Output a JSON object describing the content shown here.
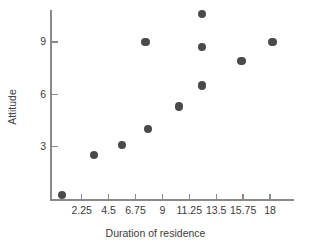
{
  "chart_data": {
    "type": "scatter",
    "title": "",
    "xlabel": "Duration of residence",
    "ylabel": "Attitude",
    "xlim": [
      0,
      19.7
    ],
    "ylim": [
      0,
      11.3
    ],
    "grid": false,
    "legend": null,
    "xticks": [
      2.25,
      4.5,
      6.75,
      9,
      11.25,
      13.5,
      15.75,
      18
    ],
    "xtick_labels": [
      "2.25",
      "4.5",
      "6.75",
      "9",
      "11.25",
      "13.5",
      "15.75",
      "18"
    ],
    "yticks": [
      3,
      6,
      9
    ],
    "ytick_labels": [
      "3",
      "6",
      "9"
    ],
    "marker": "filled-circle",
    "marker_color": "#4a4a4a",
    "axis_color": "#8a8a8a",
    "text_color": "#3b3b3b",
    "background_color": "#ffffff",
    "points": [
      {
        "x": 0.6,
        "y": 0.2
      },
      {
        "x": 3.3,
        "y": 2.5
      },
      {
        "x": 5.6,
        "y": 3.1
      },
      {
        "x": 7.6,
        "y": 9.0
      },
      {
        "x": 7.8,
        "y": 4.0
      },
      {
        "x": 10.4,
        "y": 5.3
      },
      {
        "x": 12.3,
        "y": 10.6
      },
      {
        "x": 12.3,
        "y": 8.7
      },
      {
        "x": 12.3,
        "y": 6.5
      },
      {
        "x": 15.6,
        "y": 7.9
      },
      {
        "x": 18.2,
        "y": 9.0
      }
    ]
  }
}
